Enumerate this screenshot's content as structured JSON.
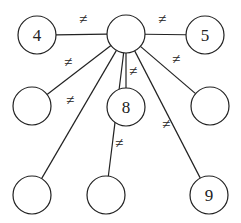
{
  "diagram": {
    "type": "graph",
    "nodes": [
      {
        "id": "center",
        "label": "",
        "x": 126,
        "y": 34
      },
      {
        "id": "n4",
        "label": "4",
        "x": 37,
        "y": 35
      },
      {
        "id": "n5",
        "label": "5",
        "x": 205,
        "y": 35
      },
      {
        "id": "midLeft",
        "label": "",
        "x": 32,
        "y": 106
      },
      {
        "id": "n8",
        "label": "8",
        "x": 126,
        "y": 107
      },
      {
        "id": "midRight",
        "label": "",
        "x": 210,
        "y": 106
      },
      {
        "id": "botLeft",
        "label": "",
        "x": 32,
        "y": 195
      },
      {
        "id": "botMid",
        "label": "",
        "x": 106,
        "y": 195
      },
      {
        "id": "n9",
        "label": "9",
        "x": 209,
        "y": 195
      }
    ],
    "edge_label": "≠",
    "edges": [
      {
        "from": "center",
        "to": "n4",
        "label": "≠",
        "lx": 83,
        "ly": 24
      },
      {
        "from": "center",
        "to": "n5",
        "label": "≠",
        "lx": 162,
        "ly": 24
      },
      {
        "from": "center",
        "to": "midLeft",
        "label": "≠",
        "lx": 68,
        "ly": 67
      },
      {
        "from": "center",
        "to": "botLeft",
        "label": "≠",
        "lx": 70,
        "ly": 105
      },
      {
        "from": "center",
        "to": "n8",
        "label": "≠",
        "lx": 133,
        "ly": 76
      },
      {
        "from": "center",
        "to": "botMid",
        "label": "≠",
        "lx": 119,
        "ly": 148
      },
      {
        "from": "center",
        "to": "midRight",
        "label": "≠",
        "lx": 176,
        "ly": 64
      },
      {
        "from": "center",
        "to": "n9",
        "label": "≠",
        "lx": 166,
        "ly": 129
      }
    ]
  }
}
